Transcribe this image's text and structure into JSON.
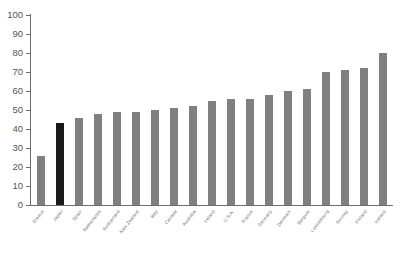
{
  "chart_data": {
    "type": "bar",
    "title": "",
    "subtitle": "",
    "xlabel": "",
    "ylabel": "",
    "ylim": [
      0,
      100
    ],
    "yticks": [
      0,
      10,
      20,
      30,
      40,
      50,
      60,
      70,
      80,
      90,
      100
    ],
    "grid": false,
    "legend": null,
    "sorted": "ascending",
    "bar_color": "#808080",
    "highlight_color": "#1a1a1a",
    "highlight_index": 1,
    "categories": [
      "Greece",
      "Japan",
      "Spain",
      "Netherlands",
      "Switzerland",
      "New Zealand",
      "Italy",
      "Canada",
      "Australia",
      "France",
      "Germany",
      "Denmark",
      "Belgium",
      "Austria",
      "U.S.A.",
      "Finland",
      "Norway",
      "Sweden",
      "Iceland"
    ],
    "values": [
      26,
      43,
      46,
      48,
      49,
      50,
      52,
      55,
      56,
      58,
      60,
      61,
      70,
      72,
      80,
      50,
      52,
      55,
      56
    ],
    "series": [
      {
        "name": "value",
        "values": [
          26,
          43,
          46,
          48,
          49,
          50,
          52,
          55,
          56,
          58,
          60,
          61,
          70,
          72,
          80,
          50,
          52,
          55,
          56
        ]
      }
    ],
    "bars": [
      {
        "label": "Greece",
        "value": 26
      },
      {
        "label": "Japan",
        "value": 43,
        "highlight": true
      },
      {
        "label": "Spain",
        "value": 46
      },
      {
        "label": "Netherlands",
        "value": 48
      },
      {
        "label": "Switzerland",
        "value": 49
      },
      {
        "label": "New Zealand",
        "value": 49
      },
      {
        "label": "Italy",
        "value": 50
      },
      {
        "label": "Canada",
        "value": 51
      },
      {
        "label": "Australia",
        "value": 52
      },
      {
        "label": "Ireland",
        "value": 55
      },
      {
        "label": "U.S.A.",
        "value": 56
      },
      {
        "label": "France",
        "value": 56
      },
      {
        "label": "Germany",
        "value": 58
      },
      {
        "label": "Denmark",
        "value": 60
      },
      {
        "label": "Belgium",
        "value": 61
      },
      {
        "label": "Luxembourg",
        "value": 70
      },
      {
        "label": "Norway",
        "value": 71
      },
      {
        "label": "Finland",
        "value": 72
      },
      {
        "label": "Iceland",
        "value": 80
      }
    ]
  }
}
